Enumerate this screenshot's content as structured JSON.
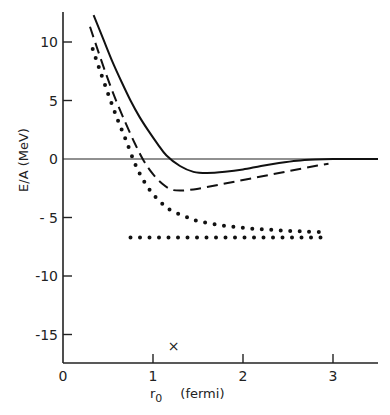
{
  "chart_data": {
    "type": "line",
    "title": "",
    "xlabel": "r0 (fermi)",
    "xlabel_main": "r",
    "xlabel_sub": "0",
    "xlabel_unit": "(fermi)",
    "ylabel": "E/A (MeV)",
    "xlim": [
      0,
      3.5
    ],
    "ylim": [
      -17,
      12.5
    ],
    "grid": false,
    "legend": null,
    "x_ticks": [
      0,
      1,
      2,
      3
    ],
    "x_tick_labels": [
      "0",
      "1",
      "2",
      "3"
    ],
    "y_ticks": [
      10,
      5,
      0,
      -5,
      -10,
      -15
    ],
    "y_tick_labels": [
      "10",
      "5",
      "0",
      "- 5",
      "-10",
      "-15"
    ],
    "zero_line": true,
    "series": [
      {
        "name": "solid",
        "style": "solid",
        "x": [
          0.34,
          0.45,
          0.55,
          0.65,
          0.75,
          0.85,
          0.95,
          1.05,
          1.15,
          1.3,
          1.45,
          1.6,
          1.8,
          2.0,
          2.2,
          2.4,
          2.6,
          2.8,
          3.0,
          3.2,
          3.5
        ],
        "y": [
          12.3,
          10.2,
          8.3,
          6.6,
          5.0,
          3.6,
          2.4,
          1.3,
          0.3,
          -0.6,
          -1.1,
          -1.2,
          -1.1,
          -0.9,
          -0.6,
          -0.35,
          -0.15,
          -0.05,
          0.0,
          0.0,
          0.0
        ]
      },
      {
        "name": "dashed",
        "style": "dashed",
        "x": [
          0.3,
          0.4,
          0.5,
          0.6,
          0.7,
          0.8,
          0.9,
          1.0,
          1.1,
          1.2,
          1.3,
          1.45,
          1.6,
          1.8,
          2.0,
          2.2,
          2.4,
          2.6,
          2.8,
          2.95
        ],
        "y": [
          11.3,
          9.0,
          6.8,
          4.8,
          3.0,
          1.3,
          -0.2,
          -1.3,
          -2.1,
          -2.6,
          -2.7,
          -2.6,
          -2.4,
          -2.1,
          -1.8,
          -1.5,
          -1.2,
          -0.9,
          -0.6,
          -0.4
        ]
      },
      {
        "name": "dotted-curve",
        "style": "dotted",
        "x": [
          0.33,
          0.4,
          0.5,
          0.6,
          0.7,
          0.8,
          0.9,
          1.0,
          1.1,
          1.2,
          1.35,
          1.5,
          1.7,
          1.9,
          2.1,
          2.3,
          2.5,
          2.7,
          2.9
        ],
        "y": [
          9.4,
          7.8,
          5.6,
          3.5,
          1.6,
          -0.4,
          -1.9,
          -3.0,
          -3.8,
          -4.4,
          -4.9,
          -5.3,
          -5.6,
          -5.8,
          -5.95,
          -6.05,
          -6.15,
          -6.2,
          -6.25
        ]
      },
      {
        "name": "dotted-flat",
        "style": "dotted",
        "x": [
          0.75,
          2.95
        ],
        "y": [
          -6.7,
          -6.7
        ]
      }
    ],
    "markers": [
      {
        "symbol": "×",
        "x": 1.23,
        "y": -15.9
      }
    ]
  }
}
